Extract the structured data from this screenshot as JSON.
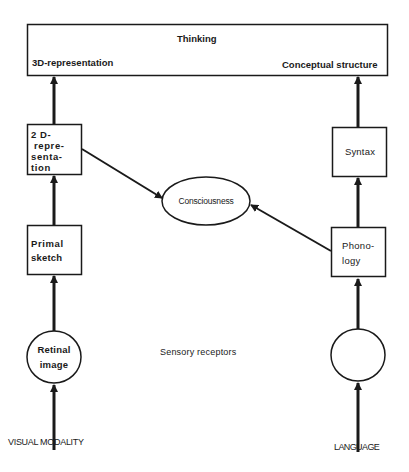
{
  "page_number": "",
  "thinking_box": {
    "title": "Thinking",
    "left_label": "3D-representation",
    "right_label": "Conceptual structure"
  },
  "visual_column": {
    "box_2d": [
      "2 D-",
      "repre-",
      "senta-",
      "tion"
    ],
    "box_primal": [
      "Primal",
      "sketch"
    ],
    "circle_retinal": [
      "Retinal",
      "image"
    ],
    "input_label": "VISUAL MODALITY"
  },
  "language_column": {
    "box_syntax": "Syntax",
    "box_phonology": [
      "Phono-",
      "logy"
    ],
    "circle_empty": "",
    "input_label": "LANGUAGE"
  },
  "center": {
    "consciousness": "Consciousness",
    "sensory_receptors": "Sensory receptors"
  },
  "colors": {
    "stroke": "#1a1a1a",
    "background": "#ffffff"
  }
}
